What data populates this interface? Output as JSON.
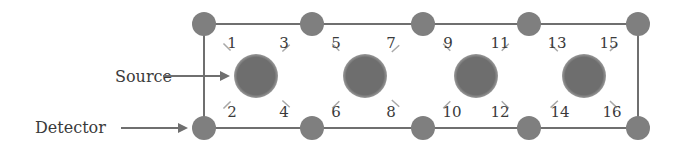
{
  "diagram": {
    "labels": {
      "source": "Source",
      "detector": "Detector"
    },
    "colors": {
      "node": "#7f7f7f",
      "frame": "#6f6f6f",
      "dash": "#a8a8a8",
      "text": "#3a3a3a"
    },
    "detectors": {
      "top": [
        {
          "x": 204,
          "y": 24
        },
        {
          "x": 312,
          "y": 24
        },
        {
          "x": 423,
          "y": 24
        },
        {
          "x": 529,
          "y": 24
        },
        {
          "x": 638,
          "y": 24
        }
      ],
      "bottom": [
        {
          "x": 204,
          "y": 128
        },
        {
          "x": 312,
          "y": 128
        },
        {
          "x": 423,
          "y": 128
        },
        {
          "x": 529,
          "y": 128
        },
        {
          "x": 638,
          "y": 128
        }
      ]
    },
    "sources": [
      {
        "x": 256,
        "y": 76
      },
      {
        "x": 365,
        "y": 76
      },
      {
        "x": 476,
        "y": 76
      },
      {
        "x": 584,
        "y": 76
      }
    ],
    "channels": [
      {
        "id": "1",
        "x": 232,
        "y": 48
      },
      {
        "id": "2",
        "x": 232,
        "y": 117
      },
      {
        "id": "3",
        "x": 284,
        "y": 48
      },
      {
        "id": "4",
        "x": 284,
        "y": 117
      },
      {
        "id": "5",
        "x": 336,
        "y": 48
      },
      {
        "id": "6",
        "x": 336,
        "y": 117
      },
      {
        "id": "7",
        "x": 391,
        "y": 48
      },
      {
        "id": "8",
        "x": 391,
        "y": 117
      },
      {
        "id": "9",
        "x": 448,
        "y": 48
      },
      {
        "id": "10",
        "x": 452,
        "y": 117
      },
      {
        "id": "11",
        "x": 500,
        "y": 48
      },
      {
        "id": "12",
        "x": 500,
        "y": 117
      },
      {
        "id": "13",
        "x": 557,
        "y": 48
      },
      {
        "id": "14",
        "x": 560,
        "y": 117
      },
      {
        "id": "15",
        "x": 609,
        "y": 48
      },
      {
        "id": "16",
        "x": 612,
        "y": 117
      }
    ]
  }
}
